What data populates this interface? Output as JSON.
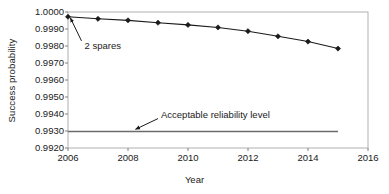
{
  "chart_data": {
    "type": "line",
    "title": "",
    "xlabel": "Year",
    "ylabel": "Success probability",
    "xlim": [
      2006,
      2016
    ],
    "ylim": [
      0.992,
      1.0
    ],
    "grid": false,
    "legend_position": "none",
    "x_ticks": [
      2006,
      2008,
      2010,
      2012,
      2014,
      2016
    ],
    "x_tick_labels": [
      "2006",
      "2008",
      "2010",
      "2012",
      "2014",
      "2016"
    ],
    "y_ticks": [
      1.0,
      0.999,
      0.998,
      0.997,
      0.996,
      0.995,
      0.994,
      0.993,
      0.992
    ],
    "y_tick_labels": [
      "1.0000",
      "0.9990",
      "0.9980",
      "0.9970",
      "0.9960",
      "0.9950",
      "0.9940",
      "0.9930",
      "0.9920"
    ],
    "x": [
      2006,
      2007,
      2008,
      2009,
      2010,
      2011,
      2012,
      2013,
      2014,
      2015
    ],
    "series": [
      {
        "name": "2 spares",
        "marker": "diamond",
        "color": "#1a1a1a",
        "values": [
          0.99972,
          0.9996,
          0.99951,
          0.99937,
          0.99924,
          0.99909,
          0.99887,
          0.99857,
          0.99826,
          0.99785
        ]
      },
      {
        "name": "Acceptable reliability level",
        "marker": "none",
        "color": "#6b6b6b",
        "values": [
          0.99297,
          0.99297,
          0.99297,
          0.99297,
          0.99297,
          0.99297,
          0.99297,
          0.99297,
          0.99297,
          0.99297
        ]
      }
    ],
    "annotations": [
      {
        "text": "2 spares",
        "text_x": 2006.55,
        "text_y": 0.998,
        "arrow_from_x": 2006.45,
        "arrow_from_y": 0.9983,
        "arrow_to_x": 2006.08,
        "arrow_to_y": 0.99965
      },
      {
        "text": "Acceptable reliability level",
        "text_x": 2009.1,
        "text_y": 0.99393,
        "arrow_from_x": 2009.0,
        "arrow_from_y": 0.99373,
        "arrow_to_x": 2008.25,
        "arrow_to_y": 0.9931
      }
    ]
  }
}
